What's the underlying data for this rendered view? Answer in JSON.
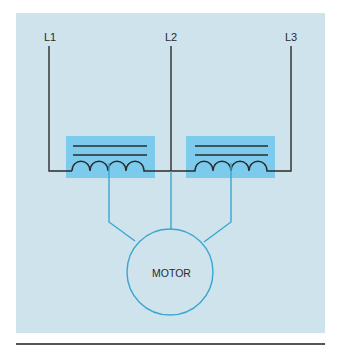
{
  "diagram": {
    "type": "wiring-schematic",
    "labels": {
      "line1": "L1",
      "line2": "L2",
      "line3": "L3",
      "motor": "MOTOR"
    },
    "components": [
      {
        "id": "coil-left",
        "kind": "transformer/coil",
        "between": [
          "L1",
          "L2"
        ],
        "taps_to_motor": 1
      },
      {
        "id": "coil-right",
        "kind": "transformer/coil",
        "between": [
          "L2",
          "L3"
        ],
        "taps_to_motor": 1
      },
      {
        "id": "motor",
        "kind": "motor",
        "connections": [
          "coil-left",
          "L2",
          "coil-right"
        ]
      }
    ],
    "colors": {
      "panel_background": "#cfe3ec",
      "coil_box": "#7ccbed",
      "wire_black": "#2b2b2b",
      "wire_blue": "#3aa6cf",
      "separator": "#555555"
    }
  }
}
